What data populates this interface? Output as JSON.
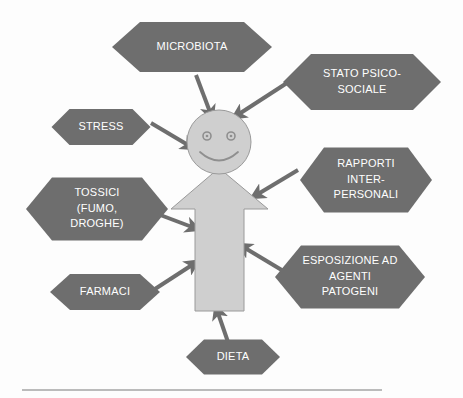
{
  "diagram": {
    "colors": {
      "hexagon_fill": "#6e6e6e",
      "hexagon_text": "#ffffff",
      "figure_fill": "#cfcfcf",
      "figure_stroke": "#9a9a9a",
      "arrow_color": "#6e6e6e",
      "background": "#fdfdfd",
      "rule_color": "#7a7a7a"
    },
    "center_figure": {
      "name": "persona",
      "head": {
        "cx": 219,
        "cy": 142,
        "r": 32
      },
      "eyes": [
        {
          "cx": 207,
          "cy": 136,
          "r": 4
        },
        {
          "cx": 231,
          "cy": 136,
          "r": 4
        }
      ],
      "mouth": "smile",
      "body_shape": "up-arrow"
    },
    "nodes": [
      {
        "id": "microbiota",
        "lines": [
          "MICROBIOTA"
        ],
        "cx": 192,
        "cy": 47,
        "w": 160,
        "h": 50,
        "notch": 28,
        "font_size": 11.5
      },
      {
        "id": "stato-psico-sociale",
        "lines": [
          "STATO PSICO-",
          "SOCIALE"
        ],
        "cx": 362,
        "cy": 82,
        "w": 158,
        "h": 56,
        "notch": 28,
        "font_size": 11.5
      },
      {
        "id": "stress",
        "lines": [
          "STRESS"
        ],
        "cx": 101,
        "cy": 127,
        "w": 99,
        "h": 36,
        "notch": 18,
        "font_size": 11
      },
      {
        "id": "rapporti-interpersonali",
        "lines": [
          "RAPPORTI",
          "INTER-",
          "PERSONALI"
        ],
        "cx": 366,
        "cy": 180,
        "w": 132,
        "h": 65,
        "notch": 24,
        "font_size": 11
      },
      {
        "id": "tossici",
        "lines": [
          "TOSSICI",
          "(FUMO,",
          "DROGHE)"
        ],
        "cx": 97,
        "cy": 209,
        "w": 142,
        "h": 63,
        "notch": 26,
        "font_size": 11
      },
      {
        "id": "esposizione-agenti-patogeni",
        "lines": [
          "ESPOSIZIONE AD",
          "AGENTI",
          "PATOGENI"
        ],
        "cx": 350,
        "cy": 277,
        "w": 150,
        "h": 63,
        "notch": 26,
        "font_size": 11
      },
      {
        "id": "farmaci",
        "lines": [
          "FARMACI"
        ],
        "cx": 105,
        "cy": 292,
        "w": 110,
        "h": 36,
        "notch": 20,
        "font_size": 11
      },
      {
        "id": "dieta",
        "lines": [
          "DIETA"
        ],
        "cx": 233,
        "cy": 357,
        "w": 94,
        "h": 35,
        "notch": 18,
        "font_size": 11
      }
    ],
    "arrows": [
      {
        "id": "microbiota-to-head",
        "x1": 196,
        "y1": 75,
        "x2": 210,
        "y2": 112,
        "width": 4
      },
      {
        "id": "stato-psico-to-head",
        "x1": 290,
        "y1": 81,
        "x2": 239,
        "y2": 114,
        "width": 4
      },
      {
        "id": "stress-to-head",
        "x1": 151,
        "y1": 123,
        "x2": 188,
        "y2": 145,
        "width": 4
      },
      {
        "id": "rapporti-to-body",
        "x1": 298,
        "y1": 170,
        "x2": 258,
        "y2": 194,
        "width": 4
      },
      {
        "id": "tossici-to-body",
        "x1": 155,
        "y1": 213,
        "x2": 192,
        "y2": 227,
        "width": 4
      },
      {
        "id": "esposizione-to-body",
        "x1": 285,
        "y1": 272,
        "x2": 245,
        "y2": 248,
        "width": 4
      },
      {
        "id": "farmaci-to-body",
        "x1": 155,
        "y1": 289,
        "x2": 192,
        "y2": 265,
        "width": 4
      },
      {
        "id": "dieta-to-body",
        "x1": 228,
        "y1": 342,
        "x2": 218,
        "y2": 313,
        "width": 4
      }
    ],
    "bottom_rule": {
      "x1": 22,
      "y1": 390,
      "x2": 382,
      "y2": 390
    }
  }
}
